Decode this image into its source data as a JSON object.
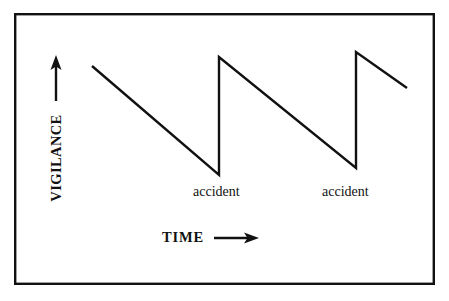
{
  "figure": {
    "kind": "line-diagram",
    "background_color": "#ffffff",
    "ink_color": "#111111",
    "border": {
      "name": "figure-border",
      "x": 14,
      "y": 13,
      "width": 421,
      "height": 272,
      "stroke_width": 2.4,
      "color": "#111111"
    },
    "axes": {
      "y_label": "VIGILANCE",
      "x_label": "TIME",
      "y_arrow": {
        "x": 56,
        "y_from": 101,
        "y_to": 57,
        "head": "up-arrow"
      },
      "x_arrow": {
        "y": 238,
        "x_from": 214,
        "x_to": 259,
        "head": "right-arrow"
      }
    },
    "annotations": [
      {
        "name": "accident-label-1",
        "text": "accident",
        "x": 193,
        "y": 185
      },
      {
        "name": "accident-label-2",
        "text": "accident",
        "x": 322,
        "y": 185
      }
    ]
  },
  "chart_data": {
    "type": "line",
    "title": "",
    "xlabel": "TIME",
    "ylabel": "VIGILANCE",
    "xlim": [
      0,
      449
    ],
    "ylim": [
      0,
      301
    ],
    "grid": false,
    "legend": null,
    "series": [
      {
        "name": "vigilance",
        "stroke_width": 2.4,
        "color": "#111111",
        "points_px": [
          [
            92,
            66
          ],
          [
            219,
            175
          ],
          [
            219,
            57
          ],
          [
            356,
            168
          ],
          [
            356,
            52
          ],
          [
            407,
            88
          ]
        ],
        "normalized": {
          "x": [
            0.0,
            0.4,
            0.4,
            0.84,
            0.84,
            1.0
          ],
          "y": [
            0.89,
            0.0,
            0.96,
            0.06,
            1.0,
            0.71
          ]
        }
      }
    ],
    "events": [
      {
        "label": "accident",
        "x_px": 219,
        "y_px": 175
      },
      {
        "label": "accident",
        "x_px": 356,
        "y_px": 168
      }
    ]
  }
}
